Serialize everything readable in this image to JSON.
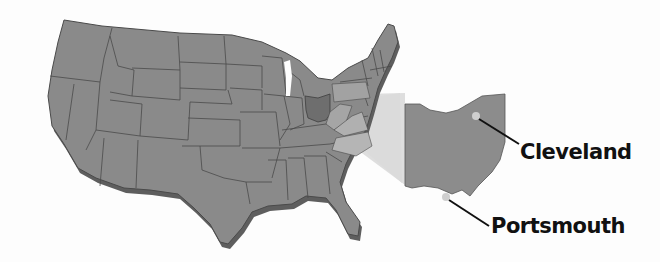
{
  "map": {
    "region": "United States",
    "highlighted_state": "Ohio",
    "colors": {
      "background": "#fdfdfd",
      "states": "#8a8a8a",
      "state_borders": "#4a4a4a",
      "shadow": "#5a5a5a",
      "ohio_highlight": "#707070",
      "inset_fill": "#8c8c8c",
      "projection_beam": "#d8d8d8",
      "city_dot": "#cfcfcf",
      "label_text": "#111111"
    },
    "cities": [
      {
        "name": "Cleveland"
      },
      {
        "name": "Portsmouth"
      }
    ]
  }
}
